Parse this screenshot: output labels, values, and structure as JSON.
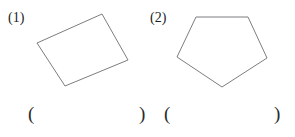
{
  "page": {
    "background_color": "#ffffff",
    "ink_color": "#222222",
    "shape_stroke_color": "#6e6e72",
    "width": 295,
    "height": 137
  },
  "problems": [
    {
      "label": "(1)",
      "shape_name": "quadrilateral",
      "shape_points": "37,43 102,14 128,60 65,86",
      "answer": {
        "open_paren": "(",
        "value": "",
        "close_paren": ")"
      }
    },
    {
      "label": "(2)",
      "shape_name": "pentagon",
      "shape_points": "49,17 101,17 120,58 75,87 30,57",
      "answer": {
        "open_paren": "(",
        "value": "",
        "close_paren": ")"
      }
    }
  ]
}
